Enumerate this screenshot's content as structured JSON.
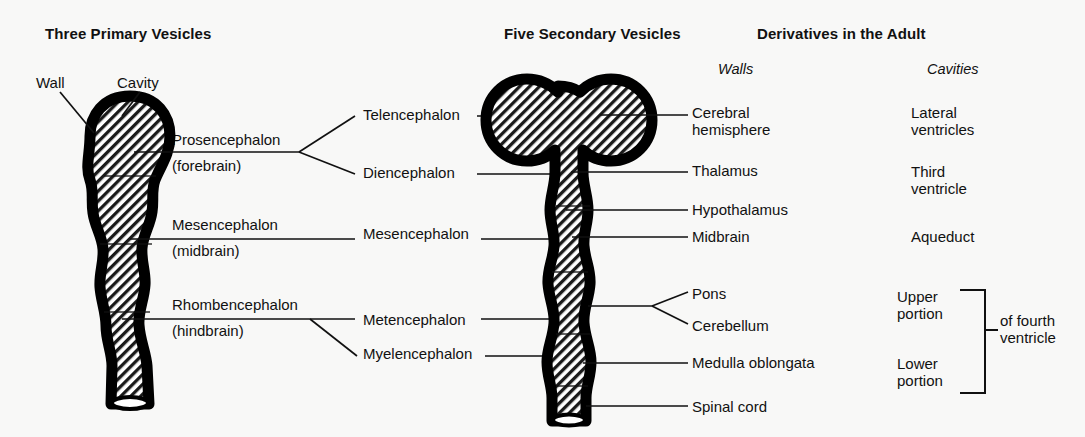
{
  "headers": {
    "primary": "Three Primary Vesicles",
    "secondary": "Five Secondary Vesicles",
    "derivatives": "Derivatives in the Adult",
    "walls": "Walls",
    "cavities": "Cavities"
  },
  "pointers": {
    "wall": "Wall",
    "cavity": "Cavity"
  },
  "primary_vesicles": [
    {
      "name": "Prosencephalon",
      "alt": "(forebrain)"
    },
    {
      "name": "Mesencephalon",
      "alt": "(midbrain)"
    },
    {
      "name": "Rhombencephalon",
      "alt": "(hindbrain)"
    }
  ],
  "secondary_vesicles": [
    {
      "name": "Telencephalon"
    },
    {
      "name": "Diencephalon"
    },
    {
      "name": "Mesencephalon"
    },
    {
      "name": "Metencephalon"
    },
    {
      "name": "Myelencephalon"
    }
  ],
  "walls": [
    {
      "line1": "Cerebral",
      "line2": "hemisphere"
    },
    {
      "line1": "Thalamus",
      "line2": ""
    },
    {
      "line1": "Hypothalamus",
      "line2": ""
    },
    {
      "line1": "Midbrain",
      "line2": ""
    },
    {
      "line1": "Pons",
      "line2": ""
    },
    {
      "line1": "Cerebellum",
      "line2": ""
    },
    {
      "line1": "Medulla oblongata",
      "line2": ""
    },
    {
      "line1": "Spinal cord",
      "line2": ""
    }
  ],
  "cavities": [
    {
      "line1": "Lateral",
      "line2": "ventricles"
    },
    {
      "line1": "Third",
      "line2": "ventricle"
    },
    {
      "line1": "Aqueduct",
      "line2": ""
    },
    {
      "line1": "Upper",
      "line2": "portion"
    },
    {
      "line1": "Lower",
      "line2": "portion"
    }
  ],
  "bracket_label": {
    "line1": "of fourth",
    "line2": "ventricle"
  },
  "colors": {
    "ink": "#111111",
    "background": "#f8f8f7",
    "wall": "#000000",
    "hatch": "#1a1a1a"
  }
}
